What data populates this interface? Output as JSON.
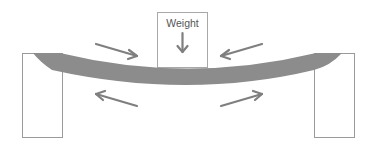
{
  "diagram": {
    "weight": {
      "label": "Weight",
      "icon": "arrow-down-icon"
    },
    "beam": {
      "description": "Simply supported beam deflecting under a central load",
      "color": "#8c8c8c"
    },
    "supports": [
      {
        "name": "left-support"
      },
      {
        "name": "right-support"
      }
    ],
    "forces": [
      {
        "name": "compression-arrow-top-left",
        "direction": "toward-center",
        "meaning": "compression on top face"
      },
      {
        "name": "compression-arrow-top-right",
        "direction": "toward-center",
        "meaning": "compression on top face"
      },
      {
        "name": "tension-arrow-bottom-left",
        "direction": "away-from-center",
        "meaning": "tension on bottom face"
      },
      {
        "name": "tension-arrow-bottom-right",
        "direction": "away-from-center",
        "meaning": "tension on bottom face"
      }
    ],
    "colors": {
      "arrow": "#7f7f7f",
      "outline": "#9a9a9a",
      "text": "#555555",
      "background": "#ffffff"
    }
  }
}
